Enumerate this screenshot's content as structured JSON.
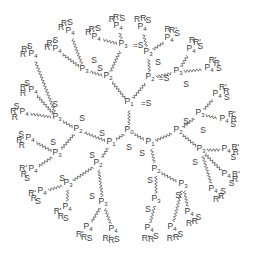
{
  "diagram": {
    "type": "phosphorus dendrimer structure",
    "core": "P0",
    "bond_color": "#555555",
    "text_color": "#3a3a3a",
    "nodes": [
      {
        "id": "P0",
        "label": "P",
        "sub": "0",
        "x": 129,
        "y": 131,
        "gen": 0
      },
      {
        "id": "P0S",
        "label": "S",
        "sub": "",
        "x": 129,
        "y": 147,
        "gen": -1
      },
      {
        "id": "P1a",
        "label": "P",
        "sub": "1",
        "x": 129,
        "y": 103,
        "gen": 1
      },
      {
        "id": "P1aS",
        "label": "=S",
        "sub": "",
        "x": 146,
        "y": 103,
        "gen": -1
      },
      {
        "id": "P1b",
        "label": "P",
        "sub": "1",
        "x": 111,
        "y": 143,
        "gen": 1
      },
      {
        "id": "P1bS",
        "label": "S",
        "sub": "",
        "x": 102,
        "y": 133,
        "gen": -1
      },
      {
        "id": "P1c",
        "label": "P",
        "sub": "1",
        "x": 150,
        "y": 143,
        "gen": 1
      },
      {
        "id": "P1cS",
        "label": "S",
        "sub": "",
        "x": 142,
        "y": 153,
        "gen": -1
      },
      {
        "id": "P2a",
        "label": "P",
        "sub": "2",
        "x": 108,
        "y": 77,
        "gen": 2
      },
      {
        "id": "P2aS",
        "label": "S",
        "sub": "",
        "x": 100,
        "y": 68,
        "gen": -1
      },
      {
        "id": "P2b",
        "label": "P",
        "sub": "2",
        "x": 150,
        "y": 78,
        "gen": 2
      },
      {
        "id": "P2bS",
        "label": "=S",
        "sub": "",
        "x": 164,
        "y": 78,
        "gen": -1
      },
      {
        "id": "P2c",
        "label": "P",
        "sub": "2",
        "x": 78,
        "y": 130,
        "gen": 2
      },
      {
        "id": "P2cS",
        "label": "S",
        "sub": "",
        "x": 82,
        "y": 118,
        "gen": -1
      },
      {
        "id": "P2d",
        "label": "P",
        "sub": "2",
        "x": 98,
        "y": 164,
        "gen": 2
      },
      {
        "id": "P2dS",
        "label": "S",
        "sub": "",
        "x": 92,
        "y": 155,
        "gen": -1
      },
      {
        "id": "P2e",
        "label": "P",
        "sub": "2",
        "x": 178,
        "y": 131,
        "gen": 2
      },
      {
        "id": "P2eS",
        "label": "S",
        "sub": "",
        "x": 186,
        "y": 121,
        "gen": -1
      },
      {
        "id": "P2f",
        "label": "P",
        "sub": "2",
        "x": 156,
        "y": 170,
        "gen": 2
      },
      {
        "id": "P2fS",
        "label": "S",
        "sub": "",
        "x": 150,
        "y": 180,
        "gen": -1
      },
      {
        "id": "P3a",
        "label": "P",
        "sub": "3",
        "x": 84,
        "y": 70,
        "gen": 3
      },
      {
        "id": "P3aS",
        "label": "S",
        "sub": "",
        "x": 94,
        "y": 60,
        "gen": -1
      },
      {
        "id": "P3b",
        "label": "P",
        "sub": "3",
        "x": 123,
        "y": 45,
        "gen": 3
      },
      {
        "id": "P3bS",
        "label": "=S",
        "sub": "",
        "x": 138,
        "y": 45,
        "gen": -1
      },
      {
        "id": "P3c",
        "label": "P",
        "sub": "3",
        "x": 148,
        "y": 53,
        "gen": 3
      },
      {
        "id": "P3cS",
        "label": "S",
        "sub": "",
        "x": 158,
        "y": 62,
        "gen": -1
      },
      {
        "id": "P3d",
        "label": "P",
        "sub": "3",
        "x": 178,
        "y": 72,
        "gen": 3
      },
      {
        "id": "P3dS",
        "label": "S",
        "sub": "",
        "x": 186,
        "y": 84,
        "gen": -1
      },
      {
        "id": "P3e",
        "label": "P",
        "sub": "3",
        "x": 57,
        "y": 118,
        "gen": 3
      },
      {
        "id": "P3eS",
        "label": "S",
        "sub": "",
        "x": 55,
        "y": 104,
        "gen": -1
      },
      {
        "id": "P3f",
        "label": "P",
        "sub": "3",
        "x": 57,
        "y": 154,
        "gen": 3
      },
      {
        "id": "P3fS",
        "label": "S",
        "sub": "",
        "x": 53,
        "y": 142,
        "gen": -1
      },
      {
        "id": "P3g",
        "label": "P",
        "sub": "3",
        "x": 103,
        "y": 203,
        "gen": 3
      },
      {
        "id": "P3gS",
        "label": "S",
        "sub": "",
        "x": 92,
        "y": 196,
        "gen": -1
      },
      {
        "id": "P3h",
        "label": "P",
        "sub": "3",
        "x": 68,
        "y": 184,
        "gen": 3
      },
      {
        "id": "P3hS",
        "label": "S",
        "sub": "",
        "x": 62,
        "y": 178,
        "gen": -1
      },
      {
        "id": "P3i",
        "label": "P",
        "sub": "3",
        "x": 200,
        "y": 114,
        "gen": 3
      },
      {
        "id": "P3iS",
        "label": "S",
        "sub": "",
        "x": 203,
        "y": 130,
        "gen": -1
      },
      {
        "id": "P3j",
        "label": "P",
        "sub": "3",
        "x": 201,
        "y": 150,
        "gen": 3
      },
      {
        "id": "P3jS",
        "label": "S",
        "sub": "",
        "x": 195,
        "y": 162,
        "gen": -1
      },
      {
        "id": "P3k",
        "label": "P",
        "sub": "3",
        "x": 183,
        "y": 185,
        "gen": 3
      },
      {
        "id": "P3kS",
        "label": "S",
        "sub": "",
        "x": 178,
        "y": 195,
        "gen": -1
      },
      {
        "id": "P3l",
        "label": "P",
        "sub": "3",
        "x": 156,
        "y": 200,
        "gen": 3
      },
      {
        "id": "P3lS",
        "label": "S",
        "sub": "",
        "x": 148,
        "y": 209,
        "gen": -1
      }
    ],
    "terminals": [
      {
        "label": "P",
        "sub": "4",
        "x": 57,
        "y": 50,
        "groups": "R R' S"
      },
      {
        "label": "P",
        "sub": "4",
        "x": 70,
        "y": 32,
        "groups": "R R' S"
      },
      {
        "label": "P",
        "sub": "4",
        "x": 96,
        "y": 38,
        "groups": "R R' S"
      },
      {
        "label": "P",
        "sub": "4",
        "x": 118,
        "y": 27,
        "groups": "R R' S"
      },
      {
        "label": "P",
        "sub": "4",
        "x": 142,
        "y": 28,
        "groups": "R' R S"
      },
      {
        "label": "P",
        "sub": "4",
        "x": 169,
        "y": 39,
        "groups": "R R' S"
      },
      {
        "label": "P",
        "sub": "4",
        "x": 191,
        "y": 50,
        "groups": "R R' S"
      },
      {
        "label": "P",
        "sub": "4",
        "x": 209,
        "y": 69,
        "groups": "R' R S"
      },
      {
        "label": "P",
        "sub": "4",
        "x": 33,
        "y": 55,
        "groups": "R R' S"
      },
      {
        "label": "P",
        "sub": "4",
        "x": 33,
        "y": 91,
        "groups": "R R' S"
      },
      {
        "label": "P",
        "sub": "4",
        "x": 24,
        "y": 113,
        "groups": "R R' S"
      },
      {
        "label": "P",
        "sub": "4",
        "x": 30,
        "y": 139,
        "groups": "R R' S"
      },
      {
        "label": "P",
        "sub": "4",
        "x": 33,
        "y": 170,
        "groups": "S R R'"
      },
      {
        "label": "P",
        "sub": "4",
        "x": 42,
        "y": 192,
        "groups": "S R R'"
      },
      {
        "label": "P",
        "sub": "4",
        "x": 67,
        "y": 208,
        "groups": "S R R'"
      },
      {
        "label": "P",
        "sub": "4",
        "x": 88,
        "y": 228,
        "groups": "S R R'"
      },
      {
        "label": "P",
        "sub": "4",
        "x": 113,
        "y": 230,
        "groups": "S R R'"
      },
      {
        "label": "P",
        "sub": "4",
        "x": 149,
        "y": 229,
        "groups": "S R R'"
      },
      {
        "label": "P",
        "sub": "4",
        "x": 172,
        "y": 228,
        "groups": "S R R'"
      },
      {
        "label": "P",
        "sub": "4",
        "x": 189,
        "y": 213,
        "groups": "S R R'"
      },
      {
        "label": "P",
        "sub": "4",
        "x": 213,
        "y": 190,
        "groups": "S R R'"
      },
      {
        "label": "P",
        "sub": "4",
        "x": 226,
        "y": 175,
        "groups": "R' R S"
      },
      {
        "label": "P",
        "sub": "4",
        "x": 226,
        "y": 150,
        "groups": "R' R S"
      },
      {
        "label": "P",
        "sub": "4",
        "x": 224,
        "y": 120,
        "groups": "R' R S"
      },
      {
        "label": "P",
        "sub": "4",
        "x": 217,
        "y": 95,
        "groups": "R' R S"
      }
    ],
    "bonds": [
      [
        "P0",
        "P1a"
      ],
      [
        "P0",
        "P1b"
      ],
      [
        "P0",
        "P1c"
      ],
      [
        "P1a",
        "P2a"
      ],
      [
        "P1a",
        "P2b"
      ],
      [
        "P1b",
        "P2c"
      ],
      [
        "P1b",
        "P2d"
      ],
      [
        "P1c",
        "P2e"
      ],
      [
        "P1c",
        "P2f"
      ],
      [
        "P2a",
        "P3a"
      ],
      [
        "P2a",
        "P3b"
      ],
      [
        "P2b",
        "P3c"
      ],
      [
        "P2b",
        "P3d"
      ],
      [
        "P2c",
        "P3e"
      ],
      [
        "P2c",
        "P3f"
      ],
      [
        "P2d",
        "P3g"
      ],
      [
        "P2d",
        "P3h"
      ],
      [
        "P2e",
        "P3i"
      ],
      [
        "P2e",
        "P3j"
      ],
      [
        "P2f",
        "P3k"
      ],
      [
        "P2f",
        "P3l"
      ]
    ],
    "terminal_bonds": [
      [
        "P3a",
        0
      ],
      [
        "P3a",
        1
      ],
      [
        "P3b",
        2
      ],
      [
        "P3b",
        3
      ],
      [
        "P3c",
        4
      ],
      [
        "P3c",
        5
      ],
      [
        "P3d",
        6
      ],
      [
        "P3d",
        7
      ],
      [
        "P3e",
        8
      ],
      [
        "P3e",
        9
      ],
      [
        "P3e",
        10
      ],
      [
        "P3f",
        11
      ],
      [
        "P3f",
        12
      ],
      [
        "P3h",
        13
      ],
      [
        "P3h",
        14
      ],
      [
        "P3g",
        15
      ],
      [
        "P3g",
        16
      ],
      [
        "P3l",
        17
      ],
      [
        "P3k",
        18
      ],
      [
        "P3k",
        19
      ],
      [
        "P3j",
        20
      ],
      [
        "P3j",
        21
      ],
      [
        "P3j",
        22
      ],
      [
        "P3i",
        23
      ],
      [
        "P3i",
        24
      ]
    ]
  }
}
